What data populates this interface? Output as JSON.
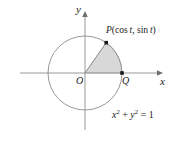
{
  "figure": {
    "axes": {
      "x_label": "x",
      "y_label": "y",
      "origin_label": "O"
    },
    "points": [
      {
        "name": "P",
        "label": "P(cos t, sin t)",
        "x": 107,
        "y": 42
      },
      {
        "name": "Q",
        "label": "Q",
        "x": 122,
        "y": 73
      }
    ],
    "point_p": {
      "var": "P",
      "open_paren": "(",
      "cos": "cos",
      "t1": "t",
      "comma": ", ",
      "sin": "sin",
      "t2": "t",
      "close_paren": ")"
    },
    "equation": {
      "x": "x",
      "x_exp": "2",
      "plus": " + ",
      "y": "y",
      "y_exp": "2",
      "equals": " = 1",
      "full": "x2 + y2 = 1"
    },
    "circle": {
      "center_x": 85,
      "center_y": 73,
      "radius": 37
    },
    "sector": {
      "start_angle_deg": 0,
      "end_angle_deg": 55,
      "fill": "#d8d8d8",
      "stroke": "#9a9a9a"
    },
    "colors": {
      "axis": "#8c8c8c",
      "circle": "#8c8c8c",
      "point": "#1a1a1a",
      "text": "#1a1a1a",
      "shade": "#d8d8d8"
    }
  }
}
